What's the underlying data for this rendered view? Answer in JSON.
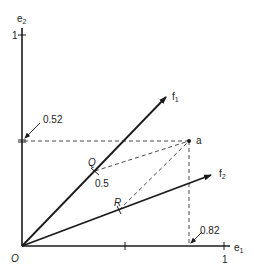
{
  "diagram": {
    "origin_label": "O",
    "axes": {
      "e1": {
        "label": "e",
        "sub": "1",
        "tick_label": "1",
        "mid_tick_value": "0.5"
      },
      "e2": {
        "label": "e",
        "sub": "2",
        "tick_label": "1"
      }
    },
    "vectors": [
      {
        "id": "f1",
        "label": "f",
        "sub": "1"
      },
      {
        "id": "f2",
        "label": "f",
        "sub": "2"
      }
    ],
    "point_a": {
      "label": "a",
      "x_coord": "0.82",
      "y_coord": "0.52"
    },
    "points_on_vectors": [
      {
        "id": "Q",
        "label": "Q",
        "value": "0.5",
        "on": "f1"
      },
      {
        "id": "R",
        "label": "R",
        "on": "f2"
      }
    ],
    "annotations": {
      "y_value_label": "0.52",
      "x_value_label": "0.82",
      "q_value_label": "0.5"
    },
    "colors": {
      "stroke": "#1a1a1a",
      "dashed": "#333333",
      "background": "#ffffff"
    }
  }
}
